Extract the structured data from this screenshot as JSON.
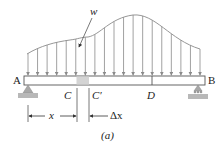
{
  "figure": {
    "caption": "(a)",
    "load_label": "w",
    "points": {
      "A": "A",
      "B": "B",
      "C": "C",
      "C_prime": "C′",
      "D": "D"
    },
    "dimensions": {
      "x": "x",
      "dx": "Δx"
    },
    "colors": {
      "line": "#555555",
      "load": "#8a8a8a",
      "element_fill": "#d4d4d4",
      "ground": "#b0b0b0"
    },
    "arrow_count": 19
  }
}
